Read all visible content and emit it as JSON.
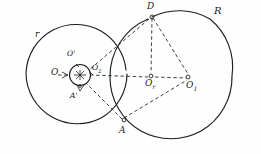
{
  "figure": {
    "kind": "hand-drawn-geometry-diagram",
    "caption": "",
    "stroke_color": "#1d1d1d",
    "background_color": "#fefefe",
    "canvas": {
      "width": 261,
      "height": 154
    },
    "shapes": {
      "circle_left": {
        "name": "left-circle",
        "cx": 76,
        "cy": 74,
        "r": 51,
        "label": "r"
      },
      "circle_right": {
        "name": "right-circle",
        "cx": 171,
        "cy": 78,
        "r": 62,
        "label": "R"
      },
      "circle_small": {
        "name": "small-circle",
        "cx": 80,
        "cy": 75,
        "r": 11,
        "label": ""
      }
    },
    "points": {
      "O": {
        "label": "O",
        "x": 57,
        "y": 75
      },
      "O_prime_small": {
        "label": "O'",
        "x": 72,
        "y": 60
      },
      "O2": {
        "label": "O",
        "sub": "2",
        "x": 94,
        "y": 72
      },
      "O_prime_center": {
        "label": "O",
        "sub": "r",
        "x": 150,
        "y": 79
      },
      "O1": {
        "label": "O",
        "sub": "1",
        "x": 190,
        "y": 80
      },
      "D": {
        "label": "D",
        "x": 152,
        "y": 12
      },
      "A": {
        "label": "A",
        "x": 125,
        "y": 122
      },
      "A_prime": {
        "label": "A'",
        "x": 76,
        "y": 95
      }
    },
    "labels": [
      {
        "name": "label-r",
        "text": "r",
        "x": 35,
        "y": 36,
        "size": "lbl-md"
      },
      {
        "name": "label-R",
        "text": "R",
        "x": 214,
        "y": 10,
        "size": "lbl-lg"
      },
      {
        "name": "label-D",
        "text": "D",
        "x": 148,
        "y": 3,
        "size": "lbl-md"
      },
      {
        "name": "label-A",
        "text": "A",
        "x": 120,
        "y": 129,
        "size": "lbl-md"
      },
      {
        "name": "label-A-prime",
        "text": "A'",
        "x": 71,
        "y": 96,
        "size": "lbl-sm"
      },
      {
        "name": "label-O",
        "text": "O",
        "x": 52,
        "y": 69,
        "size": "lbl-md"
      },
      {
        "name": "label-O-prime",
        "text": "O'",
        "x": 68,
        "y": 52,
        "size": "lbl-sm"
      }
    ],
    "sub_labels": [
      {
        "name": "label-O2",
        "base": "O",
        "sub": "2",
        "x": 93,
        "y": 66,
        "size": "lbl-sm"
      },
      {
        "name": "label-O-r",
        "base": "O",
        "sub": "r",
        "x": 146,
        "y": 81,
        "size": "lbl-md"
      },
      {
        "name": "label-O1",
        "base": "O",
        "sub": "1",
        "x": 187,
        "y": 83,
        "size": "lbl-md"
      }
    ],
    "lines": {
      "solid": [],
      "dashed": [
        {
          "name": "line-O-to-O1",
          "from": "O",
          "to": "O1"
        },
        {
          "name": "line-D-to-O-small",
          "from": "D",
          "to": "O-small"
        },
        {
          "name": "line-D-to-Or",
          "from": "D",
          "to": "O-r"
        },
        {
          "name": "line-D-to-O1",
          "from": "D",
          "to": "O1"
        },
        {
          "name": "line-A-to-small",
          "from": "A",
          "to": "small-circle"
        },
        {
          "name": "line-A-to-O1",
          "from": "A",
          "to": "O1"
        }
      ]
    }
  }
}
